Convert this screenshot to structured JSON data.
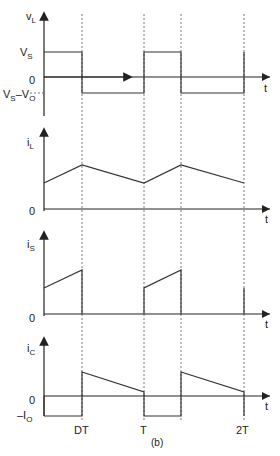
{
  "figure": {
    "caption": "(b)",
    "time_axis_label": "t",
    "time_ticks": [
      "DT",
      "T",
      "2T"
    ]
  },
  "panels": {
    "vL": {
      "ylabel_main": "v",
      "ylabel_sub": "L",
      "levels": {
        "high": {
          "main": "V",
          "sub": "S"
        },
        "zero": "0",
        "low": {
          "main": "V",
          "sub1": "S",
          "dash": "–",
          "main2": "V",
          "sub2": "O"
        }
      }
    },
    "iL": {
      "ylabel_main": "i",
      "ylabel_sub": "L",
      "zero": "0"
    },
    "iS": {
      "ylabel_main": "i",
      "ylabel_sub": "S",
      "zero": "0"
    },
    "iC": {
      "ylabel_main": "i",
      "ylabel_sub": "C",
      "zero": "0",
      "neg": {
        "main": "–I",
        "sub": "O"
      }
    }
  },
  "colors": {
    "line": "#333333",
    "dashed": "#555555",
    "background": "#ffffff"
  }
}
